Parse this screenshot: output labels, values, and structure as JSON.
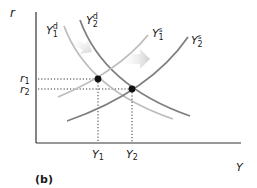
{
  "diagram": {
    "panel_label": "(b)",
    "axes": {
      "y_label": "r",
      "x_label": "Y"
    },
    "rates": {
      "r1": {
        "base": "r",
        "sub": "1"
      },
      "r2": {
        "base": "r",
        "sub": "2"
      }
    },
    "outputs": {
      "Y1": {
        "base": "Y",
        "sub": "1"
      },
      "Y2": {
        "base": "Y",
        "sub": "2"
      }
    },
    "curves": {
      "demand_1": {
        "base": "Y",
        "sup": "d",
        "sub": "1",
        "color": "#bdbdbd"
      },
      "demand_2": {
        "base": "Y",
        "sup": "d",
        "sub": "2",
        "color": "#7f7f7f"
      },
      "supply_1": {
        "base": "Y",
        "sup": "s",
        "sub": "1",
        "color": "#bdbdbd"
      },
      "supply_2": {
        "base": "Y",
        "sup": "s",
        "sub": "2",
        "color": "#7f7f7f"
      }
    },
    "equilibria": [
      {
        "label": "initial",
        "x": "Y1",
        "y": "r1"
      },
      {
        "label": "new",
        "x": "Y2",
        "y": "r2"
      }
    ],
    "colors": {
      "axis": "#333333",
      "point": "#111111",
      "arrow": "#d9d9d9"
    }
  }
}
